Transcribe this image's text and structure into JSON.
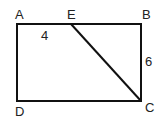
{
  "diagram": {
    "type": "geometry",
    "shape": "rectangle ABCD with segment EC",
    "vertices": {
      "A": {
        "label": "A",
        "x": 17,
        "y": 24
      },
      "B": {
        "label": "B",
        "x": 141,
        "y": 24
      },
      "C": {
        "label": "C",
        "x": 141,
        "y": 101
      },
      "D": {
        "label": "D",
        "x": 17,
        "y": 101
      },
      "E": {
        "label": "E",
        "x": 71,
        "y": 24
      }
    },
    "segments": [
      {
        "from": "A",
        "to": "B"
      },
      {
        "from": "B",
        "to": "C"
      },
      {
        "from": "C",
        "to": "D"
      },
      {
        "from": "D",
        "to": "A"
      },
      {
        "from": "E",
        "to": "C"
      }
    ],
    "measurements": {
      "AE": {
        "label": "4"
      },
      "BC": {
        "label": "6"
      }
    },
    "colors": {
      "stroke": "#111111",
      "text": "#222222",
      "background": "#ffffff"
    }
  }
}
